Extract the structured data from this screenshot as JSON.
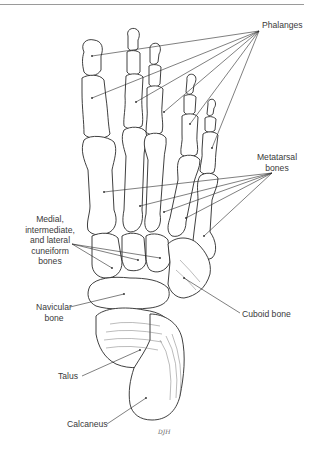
{
  "figure": {
    "labels": {
      "phalanges": "Phalanges",
      "metatarsal_line1": "Metatarsal",
      "metatarsal_line2": "bones",
      "cuneiform_line1": "Medial,",
      "cuneiform_line2": "intermediate,",
      "cuneiform_line3": "and lateral",
      "cuneiform_line4": "cuneiform",
      "cuneiform_line5": "bones",
      "navicular_line1": "Navicular",
      "navicular_line2": "bone",
      "cuboid": "Cuboid bone",
      "talus": "Talus",
      "calcaneus": "Calcaneus"
    },
    "signature": "DJH",
    "colors": {
      "line": "#2a2a2a",
      "label_text": "#3a3a3a",
      "top_rule": "#9a9a9a",
      "background": "#ffffff"
    }
  }
}
